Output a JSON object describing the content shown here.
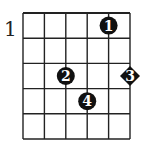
{
  "diagram": {
    "type": "chord-chart",
    "start_fret_label": "1",
    "strings": 6,
    "frets": 5,
    "markers": [
      {
        "finger": "1",
        "string": 5,
        "fret": 1,
        "shape": "circle"
      },
      {
        "finger": "2",
        "string": 3,
        "fret": 3,
        "shape": "circle"
      },
      {
        "finger": "3",
        "string": 6,
        "fret": 3,
        "shape": "diamond"
      },
      {
        "finger": "4",
        "string": 4,
        "fret": 4,
        "shape": "circle"
      }
    ]
  }
}
